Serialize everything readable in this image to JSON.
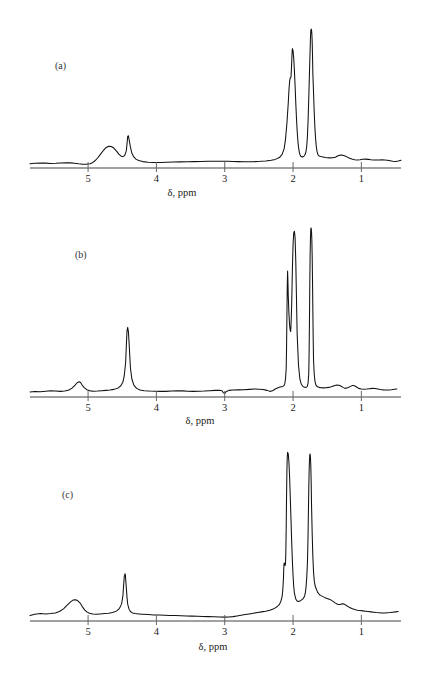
{
  "figure": {
    "kind": "nmr-spectra-figure",
    "panel_count": 3,
    "background_color": "#ffffff",
    "trace_color": "#111111",
    "axis_color": "#444444"
  },
  "axis": {
    "label": "δ,  ppm",
    "tick_labels": [
      "5",
      "4",
      "3",
      "2",
      "1"
    ],
    "tick_values": [
      5,
      4,
      3,
      2,
      1
    ],
    "direction": "decreasing-left-to-right",
    "x_min_ppm": 5.85,
    "x_max_ppm": 0.42
  },
  "panels": [
    {
      "id": "a",
      "label": "(a)",
      "peaks": [
        {
          "ppm": 4.75,
          "label": "broad hump",
          "rel_height": 0.16
        },
        {
          "ppm": 4.43,
          "label": "sharp singlet",
          "rel_height": 0.23
        },
        {
          "ppm": 2.02,
          "label": "tall peak",
          "rel_height": 0.86
        },
        {
          "ppm": 1.73,
          "label": "tallest peak",
          "rel_height": 1.0
        },
        {
          "ppm": 1.35,
          "label": "small shoulder",
          "rel_height": 0.09
        }
      ]
    },
    {
      "id": "b",
      "label": "(b)",
      "peaks": [
        {
          "ppm": 5.13,
          "label": "small hump",
          "rel_height": 0.09
        },
        {
          "ppm": 4.42,
          "label": "tall sharp singlet",
          "rel_height": 0.42
        },
        {
          "ppm": 2.05,
          "label": "very tall narrow peak",
          "rel_height": 1.0
        },
        {
          "ppm": 1.74,
          "label": "very tall narrow peak",
          "rel_height": 1.02
        },
        {
          "ppm": 1.28,
          "label": "small bump",
          "rel_height": 0.07
        },
        {
          "ppm": 1.08,
          "label": "small bump",
          "rel_height": 0.06
        }
      ]
    },
    {
      "id": "c",
      "label": "(c)",
      "peaks": [
        {
          "ppm": 5.1,
          "label": "broad hump",
          "rel_height": 0.12
        },
        {
          "ppm": 4.46,
          "label": "sharp singlet",
          "rel_height": 0.28
        },
        {
          "ppm": 2.08,
          "label": "very tall narrow peak",
          "rel_height": 1.0
        },
        {
          "ppm": 1.75,
          "label": "very tall narrow peak",
          "rel_height": 0.99
        },
        {
          "ppm": 1.28,
          "label": "small bump",
          "rel_height": 0.1
        }
      ]
    }
  ],
  "chart_data": {
    "type": "line",
    "title": "",
    "subtitle": "",
    "xlabel": "δ,  ppm",
    "ylabel": "",
    "grid": false,
    "legend": "none",
    "x_axis_reversed": true,
    "xlim": [
      5.85,
      0.42
    ],
    "xticks": [
      5,
      4,
      3,
      2,
      1
    ],
    "xticklabels": [
      "5",
      "4",
      "3",
      "2",
      "1"
    ],
    "panels": [
      {
        "name": "(a)",
        "ylim": [
          0,
          1.08
        ],
        "x": [
          5.85,
          5.78,
          5.7,
          5.62,
          5.55,
          5.47,
          5.4,
          5.33,
          5.26,
          5.2,
          5.14,
          5.08,
          5.02,
          4.97,
          4.93,
          4.9,
          4.86,
          4.82,
          4.78,
          4.74,
          4.7,
          4.66,
          4.62,
          4.58,
          4.55,
          4.52,
          4.5,
          4.48,
          4.46,
          4.44,
          4.43,
          4.42,
          4.41,
          4.4,
          4.38,
          4.36,
          4.33,
          4.3,
          4.26,
          4.2,
          4.12,
          4.04,
          3.95,
          3.85,
          3.75,
          3.65,
          3.55,
          3.45,
          3.35,
          3.25,
          3.15,
          3.05,
          2.96,
          2.88,
          2.8,
          2.72,
          2.64,
          2.56,
          2.48,
          2.4,
          2.32,
          2.26,
          2.2,
          2.16,
          2.13,
          2.11,
          2.09,
          2.07,
          2.06,
          2.05,
          2.04,
          2.03,
          2.025,
          2.02,
          2.015,
          2.01,
          2.0,
          1.99,
          1.98,
          1.97,
          1.96,
          1.95,
          1.94,
          1.93,
          1.92,
          1.91,
          1.9,
          1.89,
          1.88,
          1.87,
          1.86,
          1.85,
          1.84,
          1.83,
          1.82,
          1.81,
          1.8,
          1.79,
          1.78,
          1.77,
          1.76,
          1.75,
          1.745,
          1.74,
          1.735,
          1.73,
          1.725,
          1.72,
          1.715,
          1.71,
          1.7,
          1.69,
          1.68,
          1.67,
          1.66,
          1.65,
          1.64,
          1.63,
          1.61,
          1.59,
          1.56,
          1.53,
          1.5,
          1.46,
          1.42,
          1.38,
          1.35,
          1.32,
          1.29,
          1.26,
          1.22,
          1.18,
          1.14,
          1.1,
          1.06,
          1.02,
          0.98,
          0.94,
          0.9,
          0.86,
          0.82,
          0.78,
          0.74,
          0.7,
          0.66,
          0.62,
          0.58,
          0.54,
          0.5,
          0.46,
          0.42
        ],
        "y": [
          0.03,
          0.034,
          0.036,
          0.035,
          0.033,
          0.034,
          0.036,
          0.038,
          0.037,
          0.034,
          0.03,
          0.027,
          0.027,
          0.031,
          0.04,
          0.052,
          0.072,
          0.098,
          0.124,
          0.146,
          0.157,
          0.155,
          0.142,
          0.12,
          0.1,
          0.087,
          0.082,
          0.084,
          0.095,
          0.125,
          0.175,
          0.228,
          0.232,
          0.205,
          0.15,
          0.108,
          0.08,
          0.064,
          0.054,
          0.046,
          0.042,
          0.04,
          0.04,
          0.041,
          0.043,
          0.044,
          0.045,
          0.046,
          0.047,
          0.048,
          0.049,
          0.049,
          0.048,
          0.047,
          0.046,
          0.045,
          0.045,
          0.046,
          0.048,
          0.051,
          0.056,
          0.062,
          0.075,
          0.098,
          0.14,
          0.21,
          0.32,
          0.47,
          0.56,
          0.625,
          0.65,
          0.655,
          0.7,
          0.76,
          0.82,
          0.86,
          0.845,
          0.79,
          0.7,
          0.59,
          0.47,
          0.36,
          0.27,
          0.2,
          0.15,
          0.118,
          0.098,
          0.087,
          0.082,
          0.08,
          0.08,
          0.082,
          0.086,
          0.092,
          0.102,
          0.12,
          0.155,
          0.225,
          0.34,
          0.5,
          0.68,
          0.85,
          0.94,
          0.99,
          1.0,
          0.995,
          0.97,
          0.91,
          0.81,
          0.68,
          0.54,
          0.4,
          0.29,
          0.21,
          0.155,
          0.122,
          0.102,
          0.091,
          0.085,
          0.082,
          0.079,
          0.076,
          0.074,
          0.073,
          0.074,
          0.078,
          0.086,
          0.092,
          0.094,
          0.09,
          0.082,
          0.072,
          0.064,
          0.06,
          0.058,
          0.06,
          0.063,
          0.064,
          0.062,
          0.059,
          0.057,
          0.057,
          0.058,
          0.059,
          0.058,
          0.056,
          0.052,
          0.048,
          0.047,
          0.05,
          0.056
        ]
      },
      {
        "name": "(b)",
        "ylim": [
          0,
          1.05
        ],
        "x": [
          5.85,
          5.78,
          5.7,
          5.62,
          5.55,
          5.48,
          5.4,
          5.34,
          5.28,
          5.23,
          5.19,
          5.16,
          5.13,
          5.11,
          5.09,
          5.06,
          5.02,
          4.97,
          4.92,
          4.86,
          4.8,
          4.74,
          4.68,
          4.62,
          4.56,
          4.52,
          4.49,
          4.47,
          4.45,
          4.44,
          4.43,
          4.42,
          4.41,
          4.4,
          4.39,
          4.38,
          4.36,
          4.33,
          4.29,
          4.24,
          4.18,
          4.1,
          4.02,
          3.94,
          3.86,
          3.78,
          3.7,
          3.62,
          3.54,
          3.46,
          3.38,
          3.3,
          3.22,
          3.14,
          3.08,
          3.04,
          3.02,
          3.0,
          2.98,
          2.94,
          2.88,
          2.8,
          2.72,
          2.64,
          2.56,
          2.5,
          2.44,
          2.38,
          2.34,
          2.3,
          2.26,
          2.22,
          2.19,
          2.17,
          2.15,
          2.13,
          2.12,
          2.11,
          2.1,
          2.095,
          2.09,
          2.085,
          2.08,
          2.075,
          2.07,
          2.06,
          2.05,
          2.04,
          2.035,
          2.03,
          2.02,
          2.01,
          2.0,
          1.99,
          1.98,
          1.97,
          1.96,
          1.95,
          1.94,
          1.92,
          1.9,
          1.88,
          1.86,
          1.84,
          1.82,
          1.8,
          1.79,
          1.78,
          1.77,
          1.765,
          1.76,
          1.755,
          1.75,
          1.745,
          1.74,
          1.735,
          1.73,
          1.725,
          1.72,
          1.715,
          1.71,
          1.705,
          1.7,
          1.69,
          1.68,
          1.67,
          1.66,
          1.64,
          1.62,
          1.59,
          1.56,
          1.52,
          1.48,
          1.44,
          1.4,
          1.36,
          1.33,
          1.3,
          1.27,
          1.24,
          1.2,
          1.16,
          1.13,
          1.1,
          1.07,
          1.04,
          1.0,
          0.96,
          0.92,
          0.88,
          0.84,
          0.8,
          0.76,
          0.72,
          0.68,
          0.64,
          0.6,
          0.56,
          0.52,
          0.48,
          0.44,
          0.42
        ],
        "y": [
          0.03,
          0.033,
          0.032,
          0.035,
          0.038,
          0.036,
          0.034,
          0.036,
          0.042,
          0.055,
          0.072,
          0.086,
          0.092,
          0.088,
          0.074,
          0.058,
          0.044,
          0.037,
          0.035,
          0.036,
          0.038,
          0.04,
          0.042,
          0.046,
          0.055,
          0.068,
          0.09,
          0.13,
          0.21,
          0.31,
          0.4,
          0.42,
          0.395,
          0.33,
          0.25,
          0.175,
          0.11,
          0.072,
          0.052,
          0.042,
          0.038,
          0.036,
          0.035,
          0.034,
          0.034,
          0.036,
          0.038,
          0.037,
          0.035,
          0.034,
          0.035,
          0.036,
          0.038,
          0.04,
          0.041,
          0.038,
          0.026,
          0.022,
          0.032,
          0.04,
          0.042,
          0.043,
          0.044,
          0.046,
          0.048,
          0.047,
          0.045,
          0.04,
          0.034,
          0.038,
          0.048,
          0.056,
          0.06,
          0.062,
          0.064,
          0.07,
          0.082,
          0.11,
          0.175,
          0.3,
          0.48,
          0.66,
          0.76,
          0.7,
          0.61,
          0.5,
          0.43,
          0.4,
          0.395,
          0.43,
          0.56,
          0.76,
          0.92,
          0.99,
          1.0,
          0.96,
          0.82,
          0.6,
          0.38,
          0.19,
          0.11,
          0.078,
          0.066,
          0.06,
          0.058,
          0.06,
          0.066,
          0.085,
          0.14,
          0.26,
          0.45,
          0.68,
          0.86,
          0.96,
          1.015,
          1.02,
          1.0,
          0.95,
          0.85,
          0.7,
          0.52,
          0.35,
          0.22,
          0.14,
          0.098,
          0.078,
          0.068,
          0.062,
          0.058,
          0.056,
          0.055,
          0.056,
          0.058,
          0.062,
          0.068,
          0.072,
          0.071,
          0.066,
          0.058,
          0.052,
          0.056,
          0.064,
          0.07,
          0.068,
          0.06,
          0.052,
          0.048,
          0.047,
          0.048,
          0.05,
          0.052,
          0.051,
          0.048,
          0.045,
          0.043,
          0.042,
          0.042,
          0.044,
          0.047,
          0.048
        ]
      },
      {
        "name": "(c)",
        "ylim": [
          0,
          1.02
        ],
        "x": [
          5.85,
          5.78,
          5.7,
          5.62,
          5.55,
          5.48,
          5.42,
          5.36,
          5.31,
          5.26,
          5.22,
          5.18,
          5.15,
          5.12,
          5.1,
          5.08,
          5.05,
          5.02,
          4.98,
          4.93,
          4.88,
          4.82,
          4.76,
          4.7,
          4.64,
          4.58,
          4.54,
          4.51,
          4.49,
          4.48,
          4.47,
          4.46,
          4.455,
          4.45,
          4.44,
          4.43,
          4.42,
          4.4,
          4.38,
          4.35,
          4.31,
          4.26,
          4.2,
          4.12,
          4.04,
          3.96,
          3.88,
          3.8,
          3.72,
          3.64,
          3.56,
          3.48,
          3.4,
          3.32,
          3.24,
          3.16,
          3.08,
          3.0,
          2.94,
          2.88,
          2.82,
          2.76,
          2.7,
          2.64,
          2.58,
          2.52,
          2.46,
          2.4,
          2.34,
          2.3,
          2.26,
          2.23,
          2.2,
          2.18,
          2.16,
          2.15,
          2.14,
          2.135,
          2.13,
          2.125,
          2.12,
          2.115,
          2.11,
          2.105,
          2.1,
          2.095,
          2.09,
          2.085,
          2.08,
          2.07,
          2.06,
          2.05,
          2.04,
          2.03,
          2.02,
          2.01,
          2.0,
          1.99,
          1.98,
          1.96,
          1.94,
          1.92,
          1.9,
          1.88,
          1.86,
          1.84,
          1.83,
          1.82,
          1.81,
          1.8,
          1.79,
          1.785,
          1.78,
          1.775,
          1.77,
          1.765,
          1.76,
          1.755,
          1.75,
          1.745,
          1.74,
          1.735,
          1.73,
          1.72,
          1.71,
          1.7,
          1.69,
          1.68,
          1.67,
          1.66,
          1.65,
          1.64,
          1.62,
          1.6,
          1.57,
          1.54,
          1.5,
          1.46,
          1.42,
          1.38,
          1.34,
          1.31,
          1.28,
          1.25,
          1.22,
          1.18,
          1.14,
          1.1,
          1.06,
          1.02,
          0.98,
          0.94,
          0.9,
          0.86,
          0.82,
          0.78,
          0.74,
          0.7,
          0.66,
          0.62,
          0.58,
          0.54,
          0.5,
          0.46,
          0.42
        ],
        "y": [
          0.032,
          0.04,
          0.044,
          0.042,
          0.044,
          0.048,
          0.056,
          0.072,
          0.092,
          0.112,
          0.124,
          0.126,
          0.12,
          0.108,
          0.096,
          0.082,
          0.066,
          0.054,
          0.046,
          0.042,
          0.04,
          0.042,
          0.044,
          0.046,
          0.05,
          0.06,
          0.075,
          0.1,
          0.15,
          0.21,
          0.265,
          0.28,
          0.275,
          0.25,
          0.195,
          0.14,
          0.1,
          0.07,
          0.056,
          0.048,
          0.044,
          0.042,
          0.04,
          0.038,
          0.036,
          0.035,
          0.034,
          0.033,
          0.032,
          0.031,
          0.03,
          0.029,
          0.028,
          0.027,
          0.026,
          0.025,
          0.024,
          0.023,
          0.024,
          0.026,
          0.03,
          0.034,
          0.038,
          0.042,
          0.046,
          0.05,
          0.054,
          0.058,
          0.064,
          0.07,
          0.078,
          0.086,
          0.098,
          0.115,
          0.145,
          0.185,
          0.255,
          0.32,
          0.345,
          0.34,
          0.33,
          0.33,
          0.345,
          0.42,
          0.56,
          0.74,
          0.89,
          0.97,
          1.0,
          0.99,
          0.94,
          0.85,
          0.73,
          0.6,
          0.47,
          0.36,
          0.27,
          0.205,
          0.165,
          0.13,
          0.118,
          0.115,
          0.118,
          0.124,
          0.13,
          0.14,
          0.15,
          0.168,
          0.2,
          0.255,
          0.34,
          0.42,
          0.52,
          0.65,
          0.78,
          0.88,
          0.95,
          0.985,
          0.99,
          0.97,
          0.92,
          0.83,
          0.7,
          0.52,
          0.38,
          0.29,
          0.24,
          0.215,
          0.2,
          0.19,
          0.18,
          0.17,
          0.16,
          0.152,
          0.146,
          0.14,
          0.134,
          0.128,
          0.118,
          0.106,
          0.098,
          0.098,
          0.102,
          0.1,
          0.092,
          0.082,
          0.074,
          0.068,
          0.064,
          0.062,
          0.06,
          0.058,
          0.056,
          0.054,
          0.052,
          0.05,
          0.049,
          0.048,
          0.048,
          0.049,
          0.05,
          0.052,
          0.054,
          0.056
        ]
      }
    ]
  }
}
